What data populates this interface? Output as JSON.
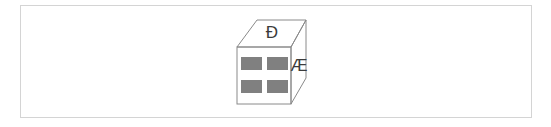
{
  "figure": {
    "kind": "oblique-cube-diagram",
    "background_color": "#ffffff",
    "frame": {
      "border_color": "#d4d4d4",
      "fill_color": "#ffffff",
      "x": 20,
      "y": 5,
      "width": 512,
      "height": 113
    },
    "cube": {
      "edge_color": "#8a8a8a",
      "face_fill_color": "#ffffff",
      "front_face": {
        "x": 237,
        "y": 47,
        "width": 54,
        "height": 57,
        "bar_color": "#808080",
        "bar_count": 4,
        "bars": [
          {
            "x": 241,
            "y": 57,
            "width": 21,
            "height": 13
          },
          {
            "x": 267,
            "y": 57,
            "width": 21,
            "height": 13
          },
          {
            "x": 241,
            "y": 80,
            "width": 21,
            "height": 13
          },
          {
            "x": 267,
            "y": 80,
            "width": 21,
            "height": 13
          }
        ]
      },
      "top_face": {
        "label": "Ð",
        "label_name": "eth-capital",
        "label_x": 272,
        "label_y": 33,
        "points": "237,47 257,20 306,20 291,47"
      },
      "right_face": {
        "label": "Æ",
        "label_name": "ae-ligature-capital",
        "label_x": 299,
        "label_y": 66,
        "points": "291,47 306,20 306,78 291,104"
      }
    }
  }
}
